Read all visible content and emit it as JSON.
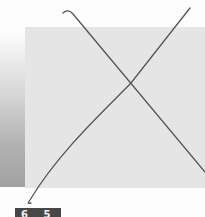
{
  "scene": {
    "description": "Gray square crossed out with a hand-drawn X",
    "colors": {
      "square": "#e5e5e5",
      "stroke": "#555555",
      "label_bg": "#474747",
      "label_text": "#f0f0f0"
    }
  },
  "label": {
    "text": "6 5"
  },
  "icons": {
    "cross_mark": "x-mark-icon"
  }
}
